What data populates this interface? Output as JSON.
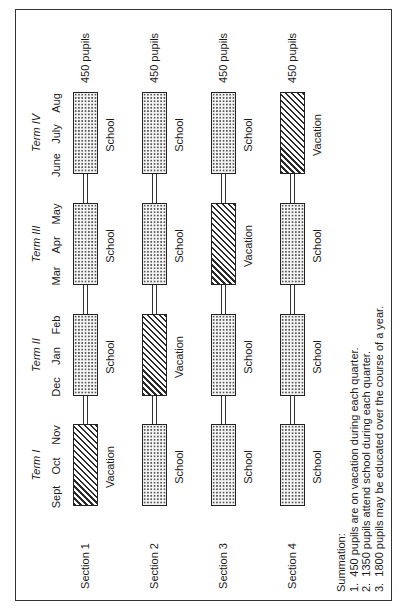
{
  "diagram": {
    "terms": [
      {
        "label": "Term I",
        "months": [
          "Sept",
          "Oct",
          "Nov"
        ]
      },
      {
        "label": "Term II",
        "months": [
          "Dec",
          "Jan",
          "Feb"
        ]
      },
      {
        "label": "Term III",
        "months": [
          "Mar",
          "Apr",
          "May"
        ]
      },
      {
        "label": "Term IV",
        "months": [
          "June",
          "July",
          "Aug"
        ]
      }
    ],
    "sections": [
      {
        "label": "Section 1",
        "pupils": "450 pupils",
        "schedule": [
          "Vacation",
          "School",
          "School",
          "School"
        ]
      },
      {
        "label": "Section 2",
        "pupils": "450 pupils",
        "schedule": [
          "School",
          "Vacation",
          "School",
          "School"
        ]
      },
      {
        "label": "Section 3",
        "pupils": "450 pupils",
        "schedule": [
          "School",
          "School",
          "Vacation",
          "School"
        ]
      },
      {
        "label": "Section 4",
        "pupils": "450 pupils",
        "schedule": [
          "School",
          "School",
          "School",
          "Vacation"
        ]
      }
    ],
    "legend_patterns": {
      "School": "dotted",
      "Vacation": "diagonal-hatch"
    },
    "colors": {
      "ink": "#222222",
      "background": "#ffffff"
    }
  },
  "summary": {
    "title": "Summation:",
    "items": [
      "1.  450 pupils are on vacation during each quarter.",
      "2.  1350 pupils attend school during each quarter.",
      "3.  1800 pupils may be educated over the course of a year."
    ]
  }
}
